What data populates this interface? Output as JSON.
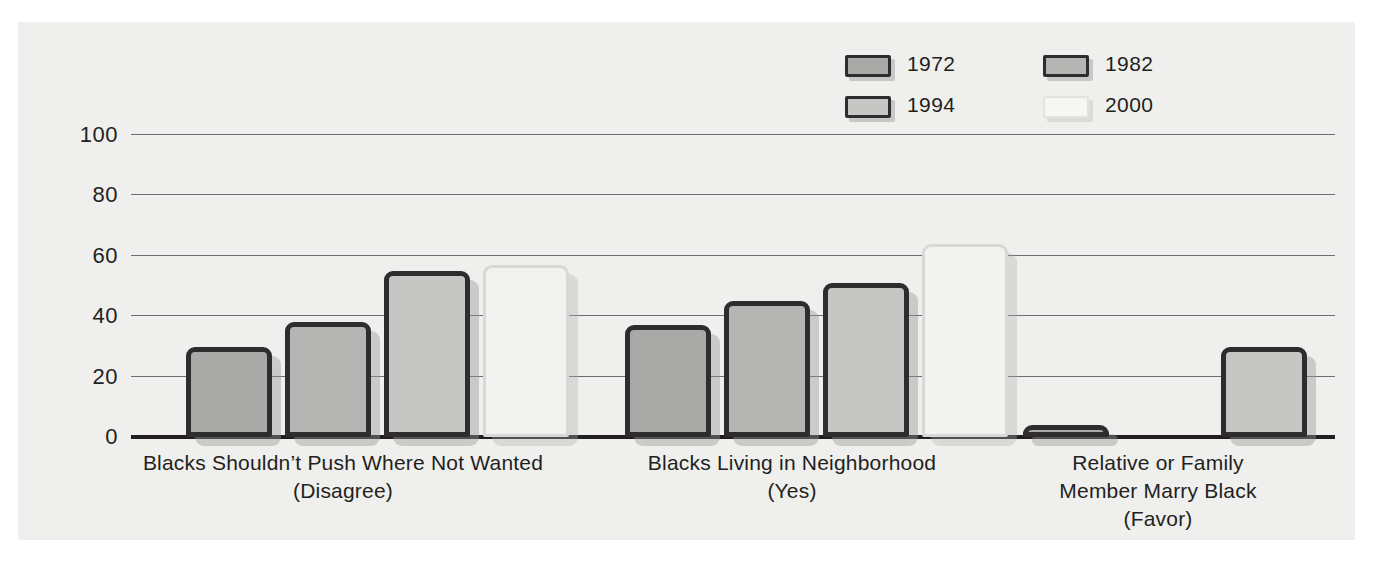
{
  "chart_data": {
    "type": "bar",
    "title": "",
    "subtitle": "",
    "xlabel": "",
    "ylabel": "",
    "ylim": [
      0,
      100
    ],
    "yticks": [
      "0",
      "20",
      "40",
      "60",
      "80",
      "100"
    ],
    "grid": true,
    "legend_position": "top-right",
    "categories": [
      "Blacks Shouldn’t Push Where Not Wanted\n(Disagree)",
      "Blacks Living in Neighborhood\n(Yes)",
      "Relative or Family\nMember Marry Black\n(Favor)"
    ],
    "category_lines": [
      [
        "Blacks Shouldn’t Push Where Not Wanted",
        "(Disagree)"
      ],
      [
        "Blacks Living in Neighborhood",
        "(Yes)"
      ],
      [
        "Relative or Family",
        "Member Marry Black",
        "(Favor)"
      ]
    ],
    "series": [
      {
        "name": "1972",
        "color": "#a9a9a7",
        "border": "#2f2c2d",
        "values": [
          30,
          37,
          4
        ]
      },
      {
        "name": "1982",
        "color": "#b4b4b2",
        "border": "#2f2c2d",
        "values": [
          38,
          45,
          null
        ]
      },
      {
        "name": "1994",
        "color": "#c6c6c4",
        "border": "#2f2c2d",
        "values": [
          55,
          51,
          30
        ]
      },
      {
        "name": "2000",
        "color": "#f2f2f0",
        "border": "#d8d8d6",
        "values": [
          57,
          64,
          null
        ]
      }
    ]
  },
  "legend": {
    "items": [
      {
        "label": "1972",
        "swatch_fill": "#a9a9a7",
        "swatch_border": "#2f2c2d"
      },
      {
        "label": "1982",
        "swatch_fill": "#b4b4b2",
        "swatch_border": "#2f2c2d"
      },
      {
        "label": "1994",
        "swatch_fill": "#c6c6c4",
        "swatch_border": "#2f2c2d"
      },
      {
        "label": "2000",
        "swatch_fill": "#f6f6f4",
        "swatch_border": "#e2e2e0"
      }
    ]
  },
  "axis": {
    "y_tick_0": "0",
    "y_tick_20": "20",
    "y_tick_40": "40",
    "y_tick_60": "60",
    "y_tick_80": "80",
    "y_tick_100": "100"
  },
  "categories": {
    "group0_line0": "Blacks Shouldn’t Push Where Not Wanted",
    "group0_line1": "(Disagree)",
    "group1_line0": "Blacks Living in Neighborhood",
    "group1_line1": "(Yes)",
    "group2_line0": "Relative or Family",
    "group2_line1": "Member Marry Black",
    "group2_line2": "(Favor)"
  },
  "colors": {
    "panel_background": "#efefed",
    "page_background": "#ffffff",
    "axis": "#231f20",
    "gridline": "#6d6e71",
    "text": "#231f20"
  }
}
